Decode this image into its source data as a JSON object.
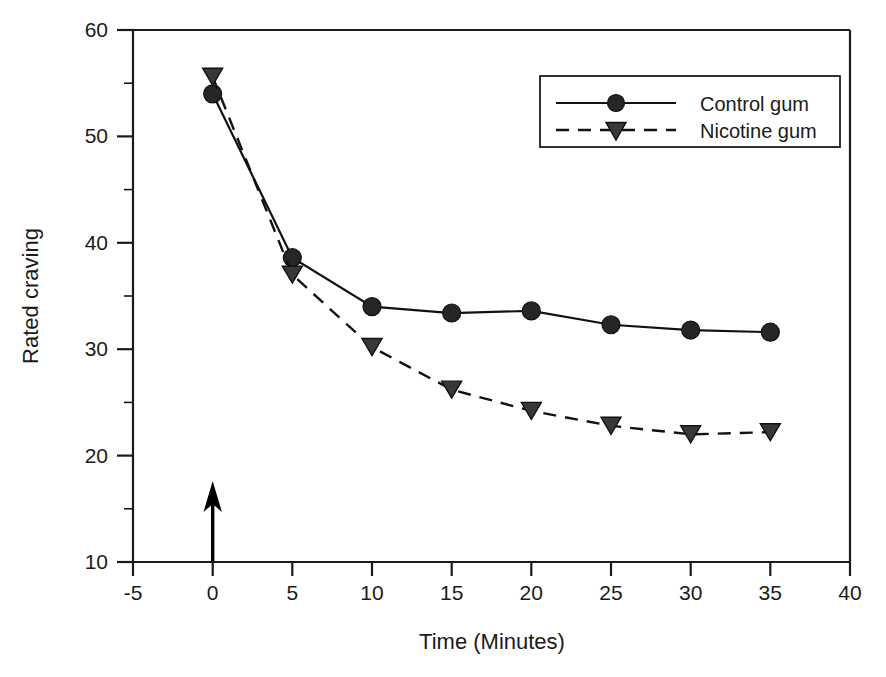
{
  "chart_data": {
    "type": "line",
    "title": "",
    "xlabel": "Time (Minutes)",
    "ylabel": "Rated craving",
    "xlim": [
      -5,
      40
    ],
    "ylim": [
      10,
      60
    ],
    "xticks": [
      -5,
      0,
      5,
      10,
      15,
      20,
      25,
      30,
      35,
      40
    ],
    "xtick_labels": [
      "-5",
      "0",
      "5",
      "10",
      "15",
      "20",
      "25",
      "30",
      "35",
      "40"
    ],
    "yticks": [
      10,
      20,
      30,
      40,
      50,
      60
    ],
    "ytick_labels": [
      "10",
      "20",
      "30",
      "40",
      "50",
      "60"
    ],
    "y_minor_ticks": [
      15,
      25,
      35,
      45,
      55
    ],
    "grid": false,
    "legend_position": "top-right",
    "x": [
      0,
      5,
      10,
      15,
      20,
      25,
      30,
      35
    ],
    "series": [
      {
        "name": "Control gum",
        "marker": "circle",
        "linestyle": "solid",
        "color": "#262626",
        "values": [
          54.0,
          38.6,
          34.0,
          33.4,
          33.6,
          32.3,
          31.8,
          31.6
        ]
      },
      {
        "name": "Nicotine gum",
        "marker": "triangle-down",
        "linestyle": "dashed",
        "color": "#383838",
        "values": [
          55.6,
          37.0,
          30.2,
          26.2,
          24.2,
          22.8,
          22.0,
          22.2
        ]
      }
    ],
    "annotations": [
      {
        "name": "gum-administration-arrow",
        "type": "arrow-up",
        "x": 0,
        "y_start": 10.0,
        "y_end": 17.3,
        "label": ""
      }
    ]
  },
  "legend": {
    "entries": [
      {
        "label": "Control gum"
      },
      {
        "label": "Nicotine gum"
      }
    ]
  },
  "axes": {
    "x_title": "Time (Minutes)",
    "y_title": "Rated craving"
  }
}
